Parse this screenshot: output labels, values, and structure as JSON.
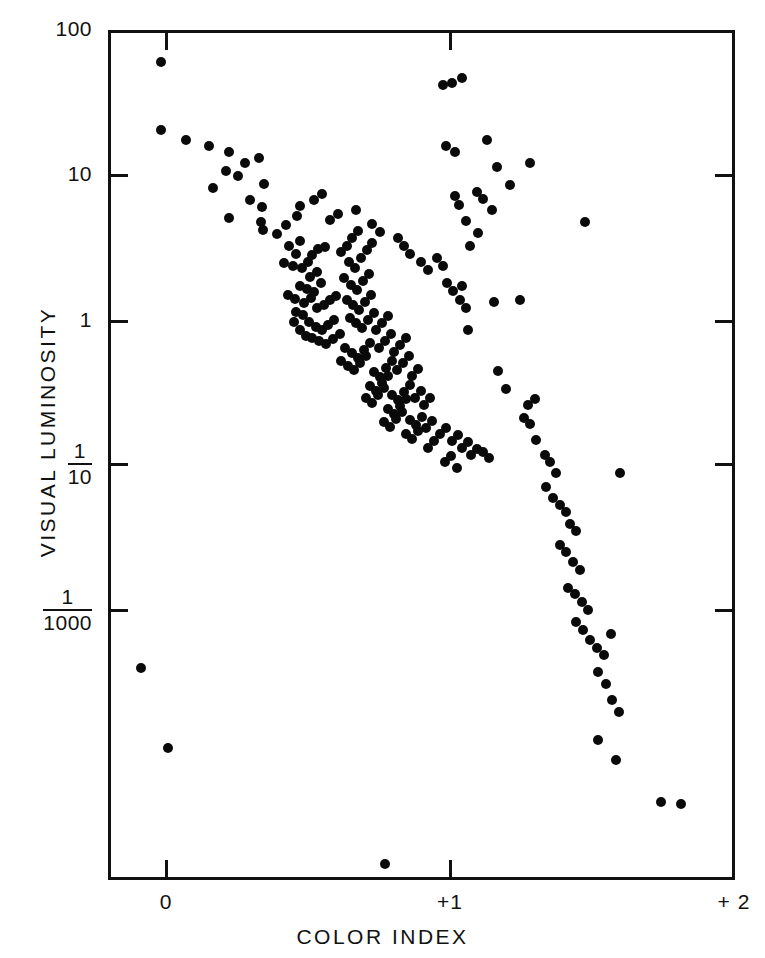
{
  "figure": {
    "background_color": "#ffffff",
    "ink_color": "#111111"
  },
  "axes": {
    "x_title": "COLOR INDEX",
    "y_title": "VISUAL LUMINOSITY",
    "x_ticks": [
      {
        "label": "0",
        "value": 0
      },
      {
        "label": "+1",
        "value": 1
      },
      {
        "label": "+ 2",
        "value": 2
      }
    ],
    "y_ticks": [
      {
        "label": "100",
        "type": "plain",
        "value": 100
      },
      {
        "label": "10",
        "type": "plain",
        "value": 10
      },
      {
        "label": "1",
        "type": "plain",
        "value": 1
      },
      {
        "label": "1/10",
        "type": "fraction",
        "numerator": "1",
        "denominator": "10",
        "value": 0.1
      },
      {
        "label": "1/1000",
        "type": "fraction",
        "numerator": "1",
        "denominator": "1000",
        "value": 0.001
      }
    ]
  },
  "chart_data": {
    "type": "scatter",
    "title": "",
    "subtitle": "",
    "xlabel": "COLOR INDEX",
    "ylabel": "VISUAL LUMINOSITY",
    "xlim": [
      -0.205,
      2.0
    ],
    "ylim_pixels_note": "log-like axis, tick labels at 100, 10, 1, 1/10, 1/1000",
    "ytick_labels": [
      "100",
      "10",
      "1",
      "1/10",
      "1/1000"
    ],
    "grid": false,
    "legend": null,
    "marker": {
      "shape": "circle",
      "color": "#0a0a0a",
      "size_px": 10
    },
    "n_points": 211,
    "series": [
      {
        "name": "stars",
        "points_px": [
          [
            161,
            62
          ],
          [
            161,
            130
          ],
          [
            186,
            140
          ],
          [
            209,
            146
          ],
          [
            229,
            152
          ],
          [
            226,
            171
          ],
          [
            238,
            176
          ],
          [
            259,
            158
          ],
          [
            264,
            184
          ],
          [
            213,
            188
          ],
          [
            245,
            163
          ],
          [
            250,
            200
          ],
          [
            229,
            218
          ],
          [
            262,
            207
          ],
          [
            261,
            222
          ],
          [
            263,
            230
          ],
          [
            277,
            234
          ],
          [
            286,
            225
          ],
          [
            297,
            216
          ],
          [
            289,
            246
          ],
          [
            296,
            254
          ],
          [
            300,
            241
          ],
          [
            284,
            263
          ],
          [
            293,
            266
          ],
          [
            302,
            268
          ],
          [
            308,
            262
          ],
          [
            312,
            255
          ],
          [
            318,
            249
          ],
          [
            325,
            247
          ],
          [
            310,
            277
          ],
          [
            317,
            272
          ],
          [
            300,
            286
          ],
          [
            307,
            289
          ],
          [
            314,
            292
          ],
          [
            321,
            283
          ],
          [
            288,
            295
          ],
          [
            295,
            299
          ],
          [
            304,
            303
          ],
          [
            311,
            298
          ],
          [
            296,
            312
          ],
          [
            303,
            315
          ],
          [
            317,
            308
          ],
          [
            324,
            305
          ],
          [
            330,
            300
          ],
          [
            336,
            296
          ],
          [
            309,
            322
          ],
          [
            316,
            327
          ],
          [
            322,
            330
          ],
          [
            328,
            325
          ],
          [
            334,
            320
          ],
          [
            312,
            338
          ],
          [
            319,
            341
          ],
          [
            326,
            344
          ],
          [
            333,
            339
          ],
          [
            340,
            334
          ],
          [
            300,
            330
          ],
          [
            306,
            336
          ],
          [
            294,
            322
          ],
          [
            341,
            252
          ],
          [
            347,
            246
          ],
          [
            352,
            238
          ],
          [
            358,
            231
          ],
          [
            349,
            262
          ],
          [
            355,
            268
          ],
          [
            361,
            258
          ],
          [
            367,
            250
          ],
          [
            372,
            243
          ],
          [
            344,
            278
          ],
          [
            351,
            285
          ],
          [
            357,
            290
          ],
          [
            363,
            281
          ],
          [
            369,
            274
          ],
          [
            347,
            300
          ],
          [
            353,
            305
          ],
          [
            359,
            310
          ],
          [
            365,
            302
          ],
          [
            371,
            295
          ],
          [
            350,
            318
          ],
          [
            356,
            323
          ],
          [
            362,
            328
          ],
          [
            368,
            320
          ],
          [
            374,
            313
          ],
          [
            345,
            348
          ],
          [
            352,
            353
          ],
          [
            358,
            358
          ],
          [
            364,
            350
          ],
          [
            370,
            343
          ],
          [
            341,
            361
          ],
          [
            348,
            366
          ],
          [
            354,
            370
          ],
          [
            360,
            363
          ],
          [
            366,
            356
          ],
          [
            376,
            330
          ],
          [
            382,
            323
          ],
          [
            388,
            316
          ],
          [
            379,
            348
          ],
          [
            385,
            341
          ],
          [
            391,
            334
          ],
          [
            374,
            372
          ],
          [
            380,
            377
          ],
          [
            386,
            368
          ],
          [
            392,
            361
          ],
          [
            370,
            386
          ],
          [
            376,
            391
          ],
          [
            382,
            383
          ],
          [
            388,
            376
          ],
          [
            366,
            398
          ],
          [
            372,
            403
          ],
          [
            378,
            395
          ],
          [
            384,
            388
          ],
          [
            394,
            352
          ],
          [
            400,
            345
          ],
          [
            406,
            338
          ],
          [
            397,
            370
          ],
          [
            403,
            363
          ],
          [
            409,
            356
          ],
          [
            392,
            395
          ],
          [
            398,
            400
          ],
          [
            404,
            392
          ],
          [
            410,
            385
          ],
          [
            388,
            409
          ],
          [
            394,
            414
          ],
          [
            400,
            406
          ],
          [
            406,
            399
          ],
          [
            384,
            422
          ],
          [
            390,
            427
          ],
          [
            396,
            419
          ],
          [
            402,
            412
          ],
          [
            412,
            376
          ],
          [
            418,
            369
          ],
          [
            415,
            398
          ],
          [
            421,
            391
          ],
          [
            410,
            420
          ],
          [
            416,
            425
          ],
          [
            422,
            417
          ],
          [
            406,
            434
          ],
          [
            412,
            439
          ],
          [
            418,
            431
          ],
          [
            424,
            405
          ],
          [
            430,
            398
          ],
          [
            426,
            428
          ],
          [
            432,
            421
          ],
          [
            428,
            448
          ],
          [
            434,
            441
          ],
          [
            440,
            434
          ],
          [
            446,
            428
          ],
          [
            452,
            441
          ],
          [
            458,
            435
          ],
          [
            462,
            448
          ],
          [
            468,
            442
          ],
          [
            445,
            462
          ],
          [
            451,
            456
          ],
          [
            457,
            468
          ],
          [
            471,
            455
          ],
          [
            477,
            449
          ],
          [
            483,
            452
          ],
          [
            489,
            458
          ],
          [
            330,
            220
          ],
          [
            338,
            214
          ],
          [
            356,
            210
          ],
          [
            372,
            224
          ],
          [
            380,
            232
          ],
          [
            314,
            200
          ],
          [
            322,
            194
          ],
          [
            300,
            206
          ],
          [
            398,
            238
          ],
          [
            404,
            246
          ],
          [
            410,
            254
          ],
          [
            421,
            262
          ],
          [
            428,
            270
          ],
          [
            437,
            258
          ],
          [
            443,
            266
          ],
          [
            447,
            283
          ],
          [
            453,
            291
          ],
          [
            460,
            300
          ],
          [
            466,
            308
          ],
          [
            443,
            85
          ],
          [
            452,
            83
          ],
          [
            462,
            78
          ],
          [
            487,
            140
          ],
          [
            497,
            167
          ],
          [
            510,
            185
          ],
          [
            530,
            163
          ],
          [
            477,
            192
          ],
          [
            483,
            199
          ],
          [
            492,
            210
          ],
          [
            466,
            221
          ],
          [
            470,
            246
          ],
          [
            478,
            233
          ],
          [
            455,
            196
          ],
          [
            459,
            205
          ],
          [
            462,
            286
          ],
          [
            468,
            330
          ],
          [
            585,
            222
          ],
          [
            446,
            146
          ],
          [
            455,
            152
          ],
          [
            494,
            302
          ],
          [
            520,
            300
          ],
          [
            498,
            371
          ],
          [
            506,
            389
          ],
          [
            528,
            405
          ],
          [
            535,
            399
          ],
          [
            524,
            418
          ],
          [
            530,
            424
          ],
          [
            536,
            440
          ],
          [
            545,
            455
          ],
          [
            550,
            462
          ],
          [
            556,
            473
          ],
          [
            546,
            487
          ],
          [
            553,
            498
          ],
          [
            560,
            505
          ],
          [
            566,
            512
          ],
          [
            570,
            524
          ],
          [
            576,
            531
          ],
          [
            560,
            545
          ],
          [
            566,
            552
          ],
          [
            573,
            562
          ],
          [
            580,
            570
          ],
          [
            568,
            588
          ],
          [
            575,
            594
          ],
          [
            582,
            602
          ],
          [
            588,
            610
          ],
          [
            576,
            622
          ],
          [
            583,
            630
          ],
          [
            590,
            640
          ],
          [
            597,
            648
          ],
          [
            620,
            473
          ],
          [
            604,
            655
          ],
          [
            611,
            634
          ],
          [
            598,
            672
          ],
          [
            606,
            684
          ],
          [
            612,
            700
          ],
          [
            619,
            712
          ],
          [
            598,
            740
          ],
          [
            616,
            760
          ],
          [
            661,
            802
          ],
          [
            681,
            804
          ],
          [
            141,
            668
          ],
          [
            168,
            748
          ],
          [
            385,
            864
          ]
        ]
      }
    ]
  }
}
